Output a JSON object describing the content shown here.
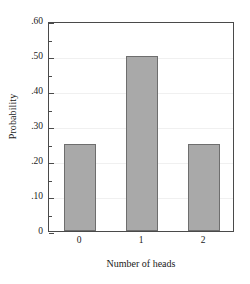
{
  "chart_data": {
    "type": "bar",
    "title": "",
    "xlabel": "Number of heads",
    "ylabel": "Probability",
    "categories": [
      "0",
      "1",
      "2"
    ],
    "values": [
      0.25,
      0.5,
      0.25
    ],
    "ylim": [
      0,
      0.6
    ],
    "ytick_values": [
      0,
      0.1,
      0.2,
      0.3,
      0.4,
      0.5,
      0.6
    ],
    "ytick_labels": [
      "0",
      ".10",
      ".20",
      ".30",
      ".40",
      ".50",
      ".60"
    ],
    "yminor_values": [
      0.05,
      0.15,
      0.25,
      0.35,
      0.45,
      0.55
    ],
    "grid": true,
    "legend": null,
    "colors": {
      "bar_fill": "#a9a9a9",
      "bar_edge": "#6e6e6e",
      "axis": "#4a4a4a",
      "grid": "#f0f0f0",
      "background": "#ffffff",
      "text": "#1a1a1a"
    }
  }
}
